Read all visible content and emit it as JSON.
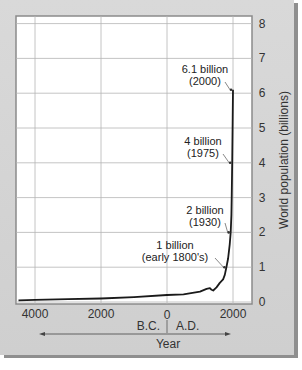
{
  "chart_data": {
    "type": "line",
    "title": "",
    "xlabel": "Year",
    "ylabel": "World population (billions)",
    "x_era_labels": [
      "B.C.",
      "A.D."
    ],
    "xticks": [
      {
        "value": -4000,
        "label": "4000"
      },
      {
        "value": -2000,
        "label": "2000"
      },
      {
        "value": 0,
        "label": "0"
      },
      {
        "value": 2000,
        "label": "2000"
      }
    ],
    "yticks": [
      "0",
      "1",
      "2",
      "3",
      "4",
      "5",
      "6",
      "7",
      "8"
    ],
    "xlim": [
      -4500,
      2600
    ],
    "ylim": [
      0,
      8
    ],
    "grid": true,
    "y_axis_position": "right",
    "series": [
      {
        "name": "World population",
        "x": [
          -4500,
          -4000,
          -3000,
          -2000,
          -1000,
          0,
          500,
          1000,
          1200,
          1300,
          1350,
          1400,
          1500,
          1600,
          1700,
          1750,
          1800,
          1850,
          1900,
          1930,
          1950,
          1960,
          1975,
          1990,
          2000
        ],
        "values": [
          0.05,
          0.06,
          0.08,
          0.1,
          0.14,
          0.2,
          0.22,
          0.3,
          0.38,
          0.4,
          0.35,
          0.33,
          0.42,
          0.55,
          0.65,
          0.78,
          1.0,
          1.25,
          1.65,
          2.0,
          2.5,
          3.0,
          4.0,
          5.3,
          6.1
        ]
      }
    ],
    "annotations": [
      {
        "line1": "6.1 billion",
        "line2": "(2000)",
        "x": 2000,
        "y": 6.1
      },
      {
        "line1": "4 billion",
        "line2": "(1975)",
        "x": 1975,
        "y": 4.0
      },
      {
        "line1": "2 billion",
        "line2": "(1930)",
        "x": 1930,
        "y": 2.0
      },
      {
        "line1": "1 billion",
        "line2": "(early 1800's)",
        "x": 1800,
        "y": 1.0
      }
    ]
  }
}
